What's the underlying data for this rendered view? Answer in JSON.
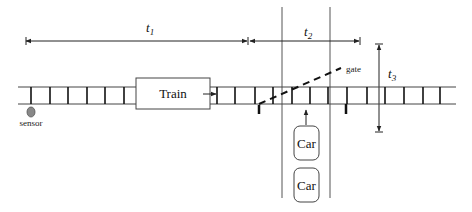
{
  "diagram": {
    "colors": {
      "stroke": "#222222",
      "light_stroke": "#555555",
      "sensor_fill": "#888888",
      "background": "#ffffff"
    },
    "labels": {
      "t1": {
        "base": "t",
        "sub": "1"
      },
      "t2": {
        "base": "t",
        "sub": "2"
      },
      "t3": {
        "base": "t",
        "sub": "3"
      },
      "gate": "gate",
      "sensor": "sensor",
      "train": "Train",
      "car_1": "Car",
      "car_2": "Car"
    },
    "track": {
      "rail_top_y": 87,
      "rail_bottom_y": 104,
      "x_start": 18,
      "x_end": 456,
      "ties_x": [
        31,
        50,
        68,
        87,
        105,
        124,
        217,
        235,
        255,
        273,
        292,
        310,
        328,
        347,
        367,
        385,
        404,
        423,
        440
      ]
    },
    "intervals": {
      "t1": {
        "x1": 26,
        "x2": 248,
        "y": 41
      },
      "t2": {
        "x1": 249,
        "x2": 360,
        "y": 41
      },
      "t3": {
        "x": 379,
        "y1": 44,
        "y2": 132
      }
    },
    "road": {
      "left_x": 282,
      "right_x": 330,
      "y_top": 7,
      "y_bottom": 198
    }
  }
}
